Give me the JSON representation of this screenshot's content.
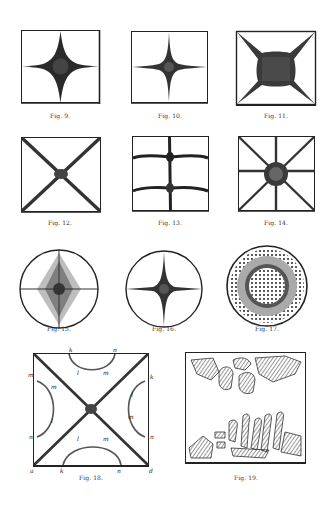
{
  "page": {
    "background": "#ffffff",
    "ink": "#222222"
  },
  "figures": [
    {
      "id": "fig9",
      "caption": "Fig. 9.",
      "shape": "square",
      "pattern": "four-point star, wide dark center"
    },
    {
      "id": "fig10",
      "caption": "Fig. 10.",
      "shape": "square",
      "pattern": "thin four-point cross"
    },
    {
      "id": "fig11",
      "caption": "Fig. 11.",
      "shape": "square",
      "pattern": "diagonal X with large dark square center"
    },
    {
      "id": "fig12",
      "caption": "Fig. 12.",
      "shape": "square",
      "pattern": "diagonal X lines"
    },
    {
      "id": "fig13",
      "caption": "Fig. 13.",
      "shape": "square",
      "pattern": "vertical line with two curved horizontal lines"
    },
    {
      "id": "fig14",
      "caption": "Fig. 14.",
      "shape": "square",
      "pattern": "eight-point star"
    },
    {
      "id": "fig15",
      "caption": "Fig. 15.",
      "shape": "circle",
      "pattern": "cross with diffuse diamond shading"
    },
    {
      "id": "fig16",
      "caption": "Fig. 16.",
      "shape": "circle",
      "pattern": "thin four-point cross"
    },
    {
      "id": "fig17",
      "caption": "Fig. 17.",
      "shape": "circle",
      "pattern": "concentric dotted rings"
    },
    {
      "id": "fig18",
      "caption": "Fig. 18.",
      "shape": "square",
      "pattern": "diagonal X with four lettered arcs",
      "letters": {
        "top": [
          "k",
          "n",
          "l",
          "m"
        ],
        "left": [
          "m",
          "m",
          "l",
          "n"
        ],
        "right": [
          "k",
          "l",
          "m",
          "n"
        ],
        "bottom": [
          "a",
          "k",
          "n",
          "d",
          "l",
          "m"
        ]
      }
    },
    {
      "id": "fig19",
      "caption": "Fig. 19.",
      "shape": "square",
      "pattern": "hatched crystal clusters top and bottom"
    }
  ]
}
